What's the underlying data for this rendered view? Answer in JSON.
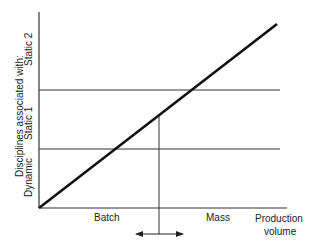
{
  "diagram": {
    "y_axis": {
      "title": "Disciplines associated with:",
      "levels": [
        "Dynamic",
        "Static 1",
        "Static 2"
      ]
    },
    "x_axis": {
      "title_line1": "Production",
      "title_line2": "volume",
      "regions": [
        "Batch",
        "Mass"
      ]
    },
    "elements": {
      "diagonal": "production volume trend line",
      "thresholds": [
        "Static 1 / Static 2 boundary",
        "Dynamic / Static 1 boundary"
      ],
      "marker": "vertical line with double-headed arrow"
    },
    "colors": {
      "line": "#111111",
      "thin_line": "#333333",
      "background": "#ffffff"
    }
  }
}
